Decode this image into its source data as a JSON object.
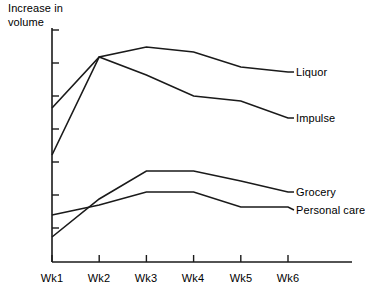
{
  "chart_data": {
    "type": "line",
    "title": "",
    "ylabel": "Increase in\nvolume",
    "xlabel": "",
    "categories": [
      "Wk1",
      "Wk2",
      "Wk3",
      "Wk4",
      "Wk5",
      "Wk6"
    ],
    "grid": false,
    "legend_position": "right-inline-labels",
    "axis_ranges": {
      "x_pixels": [
        52,
        288
      ],
      "y_pixels": [
        262,
        30
      ],
      "y_tick_pixels": [
        30,
        63,
        96,
        129,
        162,
        195,
        228
      ],
      "y_tick_labels": []
    },
    "series": [
      {
        "name": "Liquor",
        "label_y": 72,
        "values": [
          155,
          57,
          47,
          52,
          67,
          72
        ]
      },
      {
        "name": "Impulse",
        "label_y": 118,
        "values": [
          108,
          57,
          75,
          96,
          101,
          118
        ]
      },
      {
        "name": "Grocery",
        "label_y": 192,
        "values": [
          237,
          199,
          171,
          171,
          181,
          192
        ]
      },
      {
        "name": "Personal care",
        "label_y": 210,
        "values": [
          215,
          205,
          192,
          192,
          207,
          207
        ]
      }
    ]
  },
  "axis": {
    "y_label": "Increase in\nvolume"
  },
  "series_labels": {
    "liquor": "Liquor",
    "impulse": "Impulse",
    "grocery": "Grocery",
    "personal_care": "Personal care"
  },
  "x_labels": {
    "wk1": "Wk1",
    "wk2": "Wk2",
    "wk3": "Wk3",
    "wk4": "Wk4",
    "wk5": "Wk5",
    "wk6": "Wk6"
  },
  "colors": {
    "line": "#1a1a1a",
    "axis": "#1a1a1a",
    "background": "#ffffff",
    "text": "#000000"
  }
}
